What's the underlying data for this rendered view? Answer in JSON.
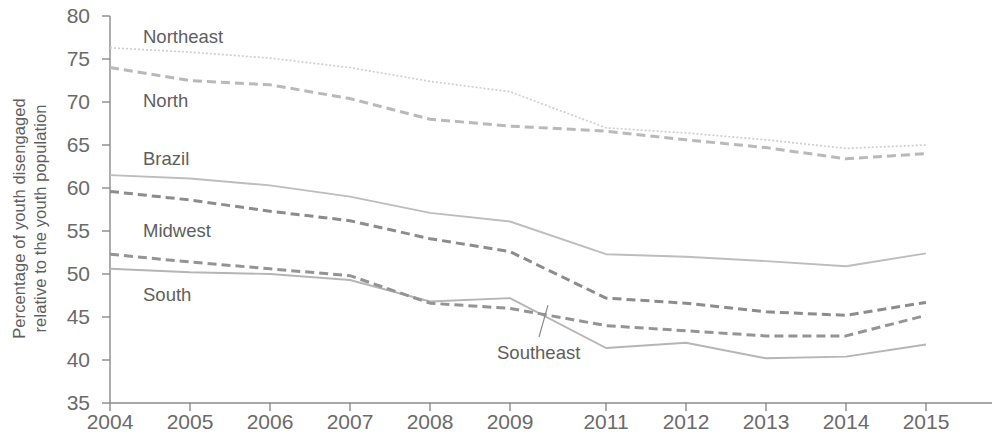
{
  "chart_data": {
    "type": "line",
    "title": "",
    "xlabel": "",
    "ylabel": "Percentage of youth disengaged relative to the youth population",
    "ylabel_line1": "Percentage of youth disengaged",
    "ylabel_line2": "relative to the youth population",
    "x": [
      "2004",
      "2005",
      "2006",
      "2007",
      "2008",
      "2009",
      "2011",
      "2012",
      "2013",
      "2014",
      "2015"
    ],
    "categories": [
      "2004",
      "2005",
      "2006",
      "2007",
      "2008",
      "2009",
      "2011",
      "2012",
      "2013",
      "2014",
      "2015"
    ],
    "xticklabels": [
      "2004",
      "2005",
      "2006",
      "2007",
      "2008",
      "2009",
      "2011",
      "2012",
      "2013",
      "2014",
      "2015"
    ],
    "yticklabels": [
      "80",
      "75",
      "70",
      "65",
      "60",
      "55",
      "50",
      "45",
      "40",
      "35"
    ],
    "yticks": [
      80,
      75,
      70,
      65,
      60,
      55,
      50,
      45,
      40,
      35
    ],
    "ylim": [
      35,
      80
    ],
    "grid": false,
    "legend": "inline-labels",
    "series": [
      {
        "name": "Northeast",
        "style": "dotted",
        "color": "#cfcfcf",
        "label_x": 143,
        "label_y": 28,
        "values": [
          76.3,
          75.8,
          75.1,
          74.0,
          72.4,
          71.2,
          67.0,
          66.4,
          65.6,
          64.6,
          65.0
        ]
      },
      {
        "name": "North",
        "style": "dashed",
        "color": "#b9b9b9",
        "label_x": 143,
        "label_y": 92,
        "values": [
          74.0,
          72.5,
          72.0,
          70.4,
          68.0,
          67.2,
          66.6,
          65.6,
          64.7,
          63.4,
          64.0
        ]
      },
      {
        "name": "Brazil",
        "style": "solid",
        "color": "#bdbdbd",
        "label_x": 143,
        "label_y": 150,
        "values": [
          61.5,
          61.1,
          60.3,
          59.0,
          57.1,
          56.1,
          52.3,
          52.0,
          51.5,
          50.9,
          52.4
        ]
      },
      {
        "name": "Midwest",
        "style": "dashed",
        "color": "#8c8c8c",
        "label_x": 143,
        "label_y": 222,
        "values": [
          59.6,
          58.6,
          57.3,
          56.2,
          54.1,
          52.6,
          47.2,
          46.6,
          45.6,
          45.2,
          46.7
        ]
      },
      {
        "name": "Southeast",
        "style": "solid",
        "color": "#b5b5b5",
        "label_x": 497,
        "label_y": 344,
        "values": [
          50.6,
          50.2,
          50.0,
          49.3,
          46.8,
          47.2,
          41.4,
          42.0,
          40.2,
          40.4,
          41.8
        ]
      },
      {
        "name": "South",
        "style": "dashed",
        "color": "#949494",
        "label_x": 143,
        "label_y": 286,
        "values": [
          52.3,
          51.4,
          50.6,
          49.8,
          46.6,
          46.0,
          44.0,
          43.4,
          42.8,
          42.8,
          45.2
        ]
      }
    ],
    "annotations": [
      {
        "text": "Southeast",
        "points_to_series": "Southeast",
        "points_to_year": "2009"
      }
    ],
    "axis_color": "#8a8a8a"
  },
  "axis": {
    "y_ticks": [
      {
        "label": "80",
        "y": 16
      },
      {
        "label": "75",
        "y": 59
      },
      {
        "label": "70",
        "y": 102
      },
      {
        "label": "65",
        "y": 145
      },
      {
        "label": "60",
        "y": 188
      },
      {
        "label": "55",
        "y": 231
      },
      {
        "label": "50",
        "y": 274
      },
      {
        "label": "45",
        "y": 317
      },
      {
        "label": "40",
        "y": 360
      },
      {
        "label": "35",
        "y": 403
      }
    ],
    "x_ticks": [
      {
        "label": "2004",
        "x": 110
      },
      {
        "label": "2005",
        "x": 190
      },
      {
        "label": "2006",
        "x": 270
      },
      {
        "label": "2007",
        "x": 350
      },
      {
        "label": "2008",
        "x": 430
      },
      {
        "label": "2009",
        "x": 510
      },
      {
        "label": "2011",
        "x": 606
      },
      {
        "label": "2012",
        "x": 686
      },
      {
        "label": "2013",
        "x": 766
      },
      {
        "label": "2014",
        "x": 846
      },
      {
        "label": "2015",
        "x": 926
      }
    ]
  }
}
